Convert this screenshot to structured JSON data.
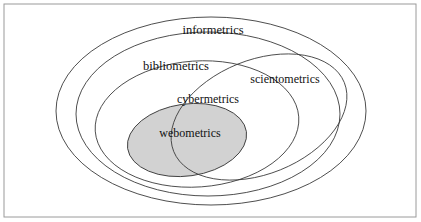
{
  "figure": {
    "title": "",
    "background_color": "#ffffff",
    "frame": {
      "stroke_color": "#9a9a9a",
      "x": 4,
      "y": 4,
      "width": 412,
      "height": 213
    }
  },
  "chart_data": {
    "type": "diagram",
    "diagram_kind": "euler-venn-nested-ellipses",
    "title": "",
    "xlabel": "",
    "ylabel": "",
    "grid": false,
    "legend": "none",
    "stroke_color": "#3a3a3a",
    "text_color": "#111111",
    "sets": [
      {
        "name": "informetrics",
        "label": "informetrics",
        "level": 1,
        "fill": "none",
        "rotation_deg": 0,
        "cx": 211,
        "cy": 111,
        "rx": 155,
        "ry": 94,
        "label_x": 213,
        "label_y": 31
      },
      {
        "name": "bibliometrics",
        "label": "bibliometrics",
        "level": 2,
        "fill": "none",
        "rotation_deg": 0,
        "cx": 208,
        "cy": 114,
        "rx": 132,
        "ry": 82,
        "label_x": 176,
        "label_y": 67
      },
      {
        "name": "scientometrics",
        "label": "scientometrics",
        "level": 3,
        "fill": "none",
        "rotation_deg": -22,
        "cx": 259,
        "cy": 117,
        "rx": 92,
        "ry": 57,
        "label_x": 285,
        "label_y": 80
      },
      {
        "name": "cybermetrics",
        "label": "cybermetrics",
        "level": 4,
        "fill": "none",
        "rotation_deg": -4,
        "cx": 197,
        "cy": 124,
        "rx": 102,
        "ry": 63,
        "label_x": 208,
        "label_y": 100
      },
      {
        "name": "webometrics",
        "label": "webometrics",
        "level": 5,
        "fill": "#d2d2d2",
        "rotation_deg": -8,
        "cx": 187,
        "cy": 140,
        "rx": 60,
        "ry": 36,
        "label_x": 190,
        "label_y": 134
      }
    ]
  }
}
